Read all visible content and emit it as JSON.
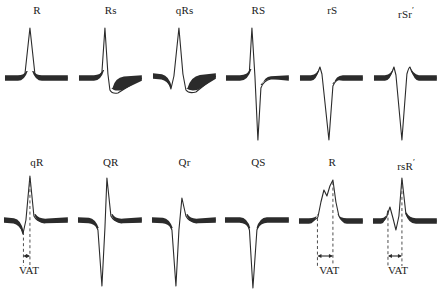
{
  "figure": {
    "ink_color": "#2b2b2b",
    "background_color": "#ffffff",
    "baseline_color": "#2b2b2b",
    "dash_color": "#3a3a3a"
  },
  "vat": {
    "label": "VAT",
    "description": "Ventricular activation time marker with double-headed arrow between dashed lines"
  },
  "panels": [
    {
      "id": "r",
      "label": "R",
      "prime": "",
      "row": "top",
      "has_vat": false,
      "components": [
        "R"
      ],
      "description": "Single tall positive R deflection from baseline"
    },
    {
      "id": "rs-lower",
      "label": "Rs",
      "prime": "",
      "row": "top",
      "has_vat": false,
      "components": [
        "R",
        "s"
      ],
      "description": "Tall R followed by small negative s"
    },
    {
      "id": "qrs",
      "label": "qRs",
      "prime": "",
      "row": "top",
      "has_vat": false,
      "components": [
        "q",
        "R",
        "s"
      ],
      "description": "Small q, tall R, small s"
    },
    {
      "id": "rs-upper",
      "label": "RS",
      "prime": "",
      "row": "top",
      "has_vat": false,
      "components": [
        "R",
        "S"
      ],
      "description": "Tall R followed by deep S"
    },
    {
      "id": "rs-small-r",
      "label": "rS",
      "prime": "",
      "row": "top",
      "has_vat": false,
      "components": [
        "r",
        "S"
      ],
      "description": "Small r followed by deep S"
    },
    {
      "id": "rsr-prime",
      "label": "rSr",
      "prime": "′",
      "row": "top",
      "has_vat": false,
      "components": [
        "r",
        "S",
        "r′"
      ],
      "description": "Small r, deep S, second small r prime"
    },
    {
      "id": "qr-small-q",
      "label": "qR",
      "prime": "",
      "row": "bottom",
      "has_vat": true,
      "components": [
        "q",
        "R"
      ],
      "description": "Small q then tall R, VAT measured to R peak"
    },
    {
      "id": "qr-large-q",
      "label": "QR",
      "prime": "",
      "row": "bottom",
      "has_vat": false,
      "components": [
        "Q",
        "R"
      ],
      "description": "Deep Q followed by tall R"
    },
    {
      "id": "qr-small-r",
      "label": "Qr",
      "prime": "",
      "row": "bottom",
      "has_vat": false,
      "components": [
        "Q",
        "r"
      ],
      "description": "Deep Q followed by shorter r"
    },
    {
      "id": "qs",
      "label": "QS",
      "prime": "",
      "row": "bottom",
      "has_vat": false,
      "components": [
        "QS"
      ],
      "description": "Single deep negative QS deflection"
    },
    {
      "id": "r-notched",
      "label": "R",
      "prime": "",
      "row": "bottom",
      "has_vat": true,
      "components": [
        "R"
      ],
      "description": "Broad notched R wave, VAT measured from onset to final peak"
    },
    {
      "id": "rsr-prime-tall",
      "label": "rsR",
      "prime": "′",
      "row": "bottom",
      "has_vat": true,
      "components": [
        "r",
        "s",
        "R′"
      ],
      "description": "Small r, small s, tall R prime, VAT measured to R prime peak"
    }
  ]
}
